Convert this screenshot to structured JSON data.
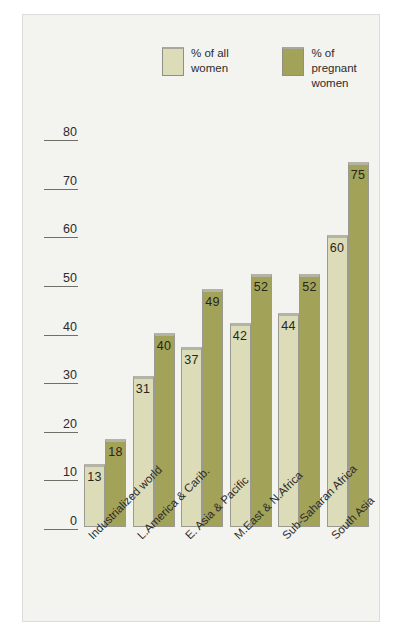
{
  "chart_data": {
    "type": "bar",
    "title": "",
    "subtitle": "",
    "xlabel": "",
    "ylabel": "",
    "ylim": [
      0,
      80
    ],
    "yticks": [
      0,
      10,
      20,
      30,
      40,
      50,
      60,
      70,
      80
    ],
    "grid": false,
    "legend_position": "top-center",
    "categories": [
      "Industrialized world",
      "L.America & Carib.",
      "E. Asia & Pacific",
      "M.East & N.Africa",
      "Sub-Saharan Africa",
      "South Asia"
    ],
    "series": [
      {
        "name": "% of all women",
        "color": "#dddcb9",
        "values": [
          13,
          31,
          37,
          42,
          44,
          60
        ]
      },
      {
        "name": "% of pregnant women",
        "color": "#a2a259",
        "values": [
          18,
          40,
          49,
          52,
          52,
          75
        ]
      }
    ]
  },
  "legend": {
    "items": [
      {
        "label": "% of all women",
        "swatch": "light"
      },
      {
        "label": "% of pregnant women",
        "swatch": "dark"
      }
    ]
  },
  "colors": {
    "panel_background": "#f3f3f0",
    "page_background": "#ffffff",
    "series_light": "#dddcb9",
    "series_dark": "#a2a259",
    "bar_outline": "#9a9a90",
    "axis_rule": "#6f6f66",
    "text": "#2b2b2b"
  }
}
